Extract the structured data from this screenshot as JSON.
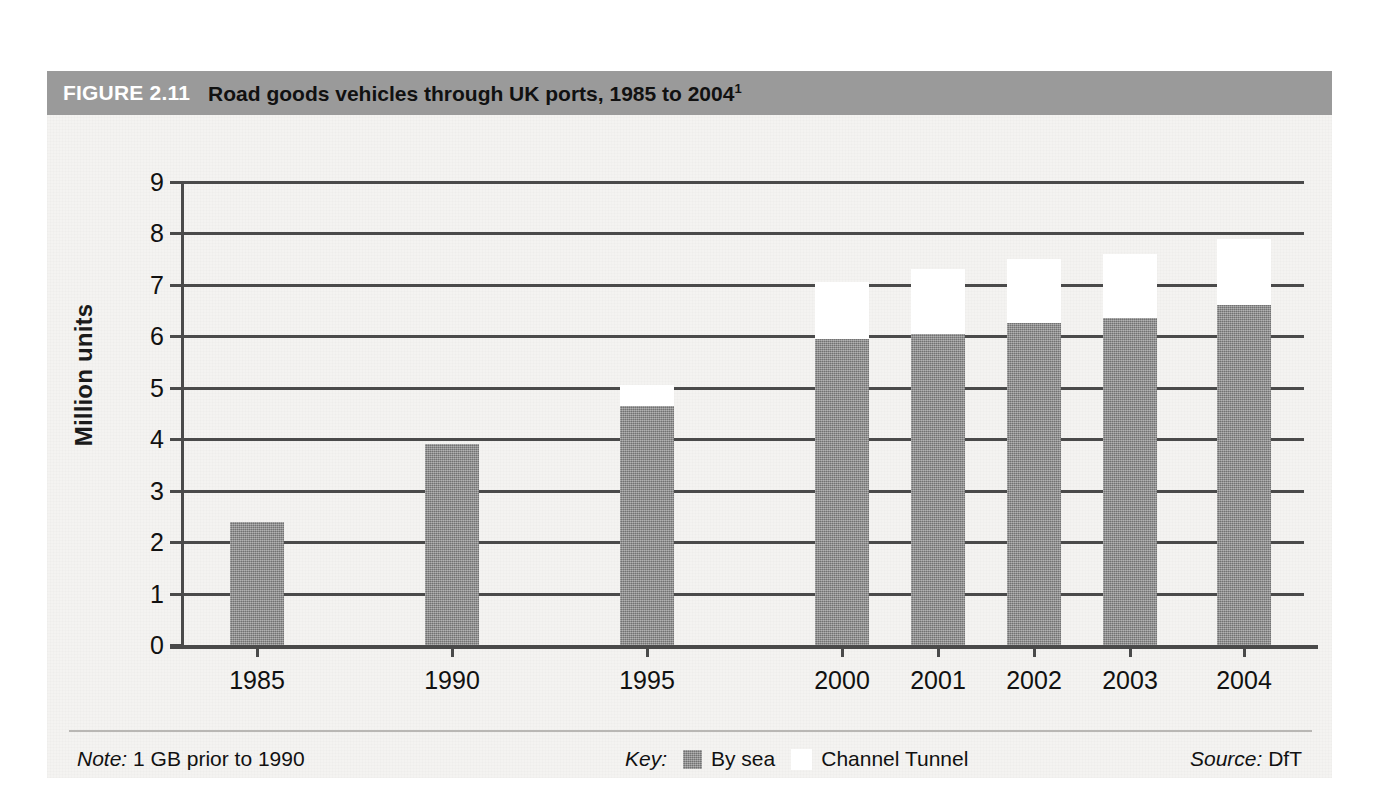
{
  "figure": {
    "number": "FIGURE 2.11",
    "title": "Road goods vehicles through UK ports, 1985 to 2004",
    "title_superscript": "1"
  },
  "footer": {
    "note_label": "Note:",
    "note_text": "1 GB prior to 1990",
    "key_label": "Key:",
    "key_items": [
      {
        "label": "By sea",
        "color": "#8a8a8a"
      },
      {
        "label": "Channel Tunnel",
        "color": "#ffffff"
      }
    ],
    "source_label": "Source:",
    "source_text": "DfT"
  },
  "chart_data": {
    "type": "bar",
    "stacked": true,
    "title": "Road goods vehicles through UK ports, 1985 to 2004",
    "xlabel": "",
    "ylabel": "Million units",
    "ylim": [
      0,
      9
    ],
    "ytick_step": 1,
    "yticks": [
      "9",
      "8",
      "7",
      "6",
      "5",
      "4",
      "3",
      "2",
      "1",
      "0"
    ],
    "grid": true,
    "grid_axis": "y",
    "legend_position": "bottom-center",
    "categories": [
      "1985",
      "1990",
      "1995",
      "2000",
      "2001",
      "2002",
      "2003",
      "2004"
    ],
    "series": [
      {
        "name": "By sea",
        "color": "#8a8a8a",
        "values": [
          2.4,
          3.9,
          4.65,
          5.95,
          6.05,
          6.25,
          6.35,
          6.6
        ]
      },
      {
        "name": "Channel Tunnel",
        "color": "#ffffff",
        "values": [
          0.0,
          0.0,
          0.4,
          1.1,
          1.25,
          1.25,
          1.25,
          1.3
        ]
      }
    ],
    "totals": [
      2.4,
      3.9,
      5.05,
      7.05,
      7.3,
      7.5,
      7.6,
      7.9
    ]
  },
  "layout": {
    "bar_width_px": 54,
    "bar_centers_px": [
      73,
      268,
      463,
      658,
      754,
      850,
      946,
      1060
    ]
  },
  "colors": {
    "header_band": "#9a9a9a",
    "page_background": "#f4f3f1",
    "axis": "#4a4a4a",
    "text": "#111111"
  }
}
